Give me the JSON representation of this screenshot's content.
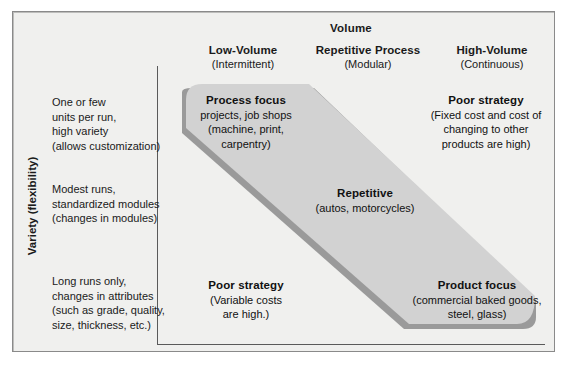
{
  "diagram": {
    "title_axis_x": "Volume",
    "axis_y_bold": "Variety",
    "axis_y_regular": " (flexibility)",
    "columns": [
      {
        "title": "Low-Volume",
        "subtitle": "(Intermittent)"
      },
      {
        "title": "Repetitive Process",
        "subtitle": "(Modular)"
      },
      {
        "title": "High-Volume",
        "subtitle": "(Continuous)"
      }
    ],
    "rows": [
      {
        "lines": [
          "One or few",
          "units per run,",
          "high variety",
          "(allows customization)"
        ]
      },
      {
        "lines": [
          "Modest runs,",
          "standardized modules",
          "(changes in modules)"
        ]
      },
      {
        "lines": [
          "Long runs only,",
          "changes in attributes",
          "(such as grade, quality,",
          "size, thickness, etc.)"
        ]
      }
    ],
    "cells": [
      {
        "id": "process-focus",
        "heading": "Process focus",
        "body": [
          "projects, job shops",
          "(machine, print,",
          "carpentry)"
        ]
      },
      {
        "id": "poor-strategy-high-volume",
        "heading": "Poor strategy",
        "body": [
          "(Fixed cost and cost of",
          "changing to other",
          "products are high)"
        ]
      },
      {
        "id": "repetitive",
        "heading": "Repetitive",
        "body": [
          "(autos, motorcycles)"
        ]
      },
      {
        "id": "poor-strategy-low-volume",
        "heading": "Poor strategy",
        "body": [
          "(Variable costs",
          "are high.)"
        ]
      },
      {
        "id": "product-focus",
        "heading": "Product focus",
        "body": [
          "(commercial baked goods,",
          "steel, glass)"
        ]
      }
    ],
    "colors": {
      "page_background": "#ffffff",
      "panel_background": "#f0f0ee",
      "panel_border": "#8a8a8a",
      "axis_line": "#5a5a5a",
      "band_fill": "#d2d2d2",
      "band_shadow": "#9a9a9a",
      "text": "#1a1a1a"
    },
    "band": {
      "description": "diagonal strategy band from low-volume/high-variety to high-volume/low-variety"
    }
  }
}
